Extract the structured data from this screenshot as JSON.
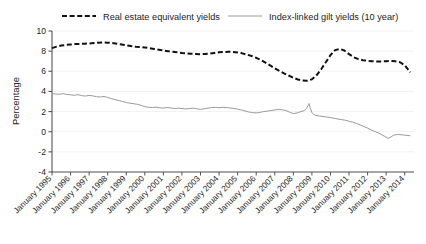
{
  "chart_data": {
    "type": "line",
    "title": "",
    "subtitle": "",
    "xlabel": "",
    "ylabel": "Percentage",
    "ylim": [
      -4,
      10
    ],
    "yticks": [
      -4,
      -2,
      0,
      2,
      4,
      6,
      8,
      10
    ],
    "ytick_labels": [
      "-4",
      "-2",
      "0",
      "2",
      "4",
      "6",
      "8",
      "10"
    ],
    "grid": true,
    "grid_axis": "y",
    "legend_position": "top",
    "x_start": 1995.0,
    "x_end": 2014.5,
    "xticks": [
      1995,
      1996,
      1997,
      1998,
      1999,
      2000,
      2001,
      2002,
      2003,
      2004,
      2005,
      2006,
      2007,
      2008,
      2009,
      2010,
      2011,
      2012,
      2013,
      2014
    ],
    "xtick_labels": [
      "January 1995",
      "January 1996",
      "January 1997",
      "January 1998",
      "January 1999",
      "January 2000",
      "January 2001",
      "January 2002",
      "January 2003",
      "January 2004",
      "January 2005",
      "January 2006",
      "January 2007",
      "January 2008",
      "January 2009",
      "January 2010",
      "January 2011",
      "January 2012",
      "January 2013",
      "January 2014"
    ],
    "series": [
      {
        "name": "Real estate equivalent yields",
        "color": "#111111",
        "style": "dashed",
        "width": 2.0,
        "x": [
          1995.0,
          1995.25,
          1995.5,
          1995.75,
          1996.0,
          1996.25,
          1996.5,
          1996.75,
          1997.0,
          1997.25,
          1997.5,
          1997.75,
          1998.0,
          1998.25,
          1998.5,
          1998.75,
          1999.0,
          1999.25,
          1999.5,
          1999.75,
          2000.0,
          2000.25,
          2000.5,
          2000.75,
          2001.0,
          2001.25,
          2001.5,
          2001.75,
          2002.0,
          2002.25,
          2002.5,
          2002.75,
          2003.0,
          2003.25,
          2003.5,
          2003.75,
          2004.0,
          2004.25,
          2004.5,
          2004.75,
          2005.0,
          2005.25,
          2005.5,
          2005.75,
          2006.0,
          2006.25,
          2006.5,
          2006.75,
          2007.0,
          2007.25,
          2007.5,
          2007.75,
          2008.0,
          2008.25,
          2008.5,
          2008.75,
          2009.0,
          2009.25,
          2009.5,
          2009.75,
          2010.0,
          2010.25,
          2010.5,
          2010.75,
          2011.0,
          2011.25,
          2011.5,
          2011.75,
          2012.0,
          2012.25,
          2012.5,
          2012.75,
          2013.0,
          2013.25,
          2013.5,
          2013.75,
          2014.0,
          2014.3
        ],
        "values": [
          8.3,
          8.45,
          8.55,
          8.62,
          8.66,
          8.7,
          8.72,
          8.74,
          8.76,
          8.8,
          8.84,
          8.86,
          8.84,
          8.8,
          8.74,
          8.66,
          8.58,
          8.5,
          8.44,
          8.4,
          8.36,
          8.3,
          8.22,
          8.14,
          8.06,
          8.0,
          7.94,
          7.88,
          7.82,
          7.78,
          7.74,
          7.72,
          7.7,
          7.72,
          7.76,
          7.82,
          7.88,
          7.92,
          7.94,
          7.92,
          7.86,
          7.78,
          7.66,
          7.52,
          7.34,
          7.12,
          6.86,
          6.58,
          6.3,
          6.04,
          5.8,
          5.58,
          5.36,
          5.18,
          5.08,
          5.06,
          5.2,
          5.6,
          6.2,
          6.9,
          7.6,
          8.1,
          8.22,
          8.06,
          7.7,
          7.4,
          7.2,
          7.1,
          7.04,
          7.0,
          6.98,
          6.98,
          7.0,
          7.02,
          7.0,
          6.9,
          6.6,
          5.9
        ]
      },
      {
        "name": "Index-linked gilt yields (10 year)",
        "color": "#9a9a9a",
        "style": "solid",
        "width": 1.0,
        "x": [
          1995.0,
          1995.2,
          1995.4,
          1995.6,
          1995.8,
          1996.0,
          1996.2,
          1996.4,
          1996.6,
          1996.8,
          1997.0,
          1997.2,
          1997.4,
          1997.6,
          1997.8,
          1998.0,
          1998.2,
          1998.4,
          1998.6,
          1998.8,
          1999.0,
          1999.2,
          1999.4,
          1999.6,
          1999.8,
          2000.0,
          2000.2,
          2000.4,
          2000.6,
          2000.8,
          2001.0,
          2001.2,
          2001.4,
          2001.6,
          2001.8,
          2002.0,
          2002.2,
          2002.4,
          2002.6,
          2002.8,
          2003.0,
          2003.2,
          2003.4,
          2003.6,
          2003.8,
          2004.0,
          2004.2,
          2004.4,
          2004.6,
          2004.8,
          2005.0,
          2005.2,
          2005.4,
          2005.6,
          2005.8,
          2006.0,
          2006.2,
          2006.4,
          2006.6,
          2006.8,
          2007.0,
          2007.2,
          2007.4,
          2007.6,
          2007.8,
          2008.0,
          2008.2,
          2008.4,
          2008.6,
          2008.7,
          2008.8,
          2008.85,
          2008.9,
          2009.0,
          2009.1,
          2009.2,
          2009.4,
          2009.6,
          2009.8,
          2010.0,
          2010.2,
          2010.4,
          2010.6,
          2010.8,
          2011.0,
          2011.2,
          2011.4,
          2011.6,
          2011.8,
          2012.0,
          2012.2,
          2012.4,
          2012.6,
          2012.8,
          2013.0,
          2013.1,
          2013.2,
          2013.4,
          2013.6,
          2013.8,
          2014.0,
          2014.3
        ],
        "values": [
          3.8,
          3.74,
          3.72,
          3.78,
          3.7,
          3.66,
          3.62,
          3.68,
          3.58,
          3.54,
          3.6,
          3.56,
          3.48,
          3.44,
          3.5,
          3.4,
          3.28,
          3.18,
          3.1,
          3.0,
          2.9,
          2.84,
          2.78,
          2.72,
          2.62,
          2.5,
          2.42,
          2.4,
          2.44,
          2.38,
          2.34,
          2.4,
          2.36,
          2.3,
          2.34,
          2.3,
          2.26,
          2.3,
          2.34,
          2.28,
          2.22,
          2.28,
          2.34,
          2.4,
          2.42,
          2.38,
          2.42,
          2.4,
          2.36,
          2.3,
          2.24,
          2.16,
          2.06,
          1.96,
          1.9,
          1.86,
          1.92,
          2.0,
          2.04,
          2.1,
          2.16,
          2.22,
          2.18,
          2.1,
          1.94,
          1.8,
          1.86,
          2.0,
          2.1,
          2.3,
          2.6,
          2.8,
          2.4,
          1.9,
          1.7,
          1.62,
          1.56,
          1.5,
          1.46,
          1.4,
          1.34,
          1.26,
          1.2,
          1.14,
          1.04,
          0.94,
          0.82,
          0.68,
          0.52,
          0.36,
          0.18,
          0.02,
          -0.14,
          -0.34,
          -0.54,
          -0.66,
          -0.58,
          -0.34,
          -0.28,
          -0.3,
          -0.34,
          -0.4
        ]
      }
    ]
  },
  "legend": {
    "items": [
      {
        "label": "Real estate equivalent yields",
        "swatch": "dashed-line-swatch"
      },
      {
        "label": "Index-linked gilt yields (10 year)",
        "swatch": "solid-line-swatch"
      }
    ]
  },
  "axes": {
    "y_title": "Percentage"
  }
}
